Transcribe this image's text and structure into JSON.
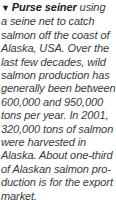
{
  "caption": {
    "marker": "▼",
    "lead": "Purse seiner",
    "lines": [
      " using",
      "a seine net to catch",
      "salmon off the coast of",
      "Alaska, USA. Over the",
      "last few decades, wild",
      "salmon production has",
      "generally been between",
      "600,000 and 950,000",
      "tons per year. In 2001,",
      "320,000 tons of salmon",
      "were harvested in",
      "Alaska. About one-third",
      "of Alaskan salmon pro-",
      "duction is for the export",
      "market."
    ]
  }
}
